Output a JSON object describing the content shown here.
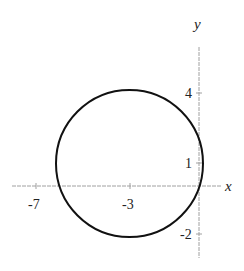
{
  "diagram": {
    "type": "circle-on-coordinate-plane",
    "axes": {
      "x_label": "x",
      "y_label": "y",
      "x_ticks": [
        {
          "value": -7,
          "label": "-7"
        },
        {
          "value": -3,
          "label": "-3"
        }
      ],
      "y_ticks": [
        {
          "value": 4,
          "label": "4"
        },
        {
          "value": 1,
          "label": "1"
        },
        {
          "value": -2,
          "label": "-2"
        }
      ],
      "axis_color": "#9a9a9a"
    },
    "circle": {
      "center": [
        -3,
        1
      ],
      "radius": 3.15,
      "stroke_color": "#111111"
    }
  }
}
